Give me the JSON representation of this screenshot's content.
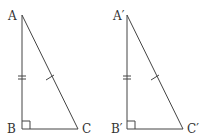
{
  "diagram": {
    "triangles": [
      {
        "name": "ABC",
        "labels": {
          "top": "A",
          "right_angle": "B",
          "base_end": "C"
        },
        "right_angle_at": "B",
        "marks": {
          "vertical_leg": "double-tick",
          "hypotenuse": "single-tick"
        }
      },
      {
        "name": "A'B'C'",
        "labels": {
          "top": "A′",
          "right_angle": "B′",
          "base_end": "C′"
        },
        "right_angle_at": "B′",
        "marks": {
          "vertical_leg": "double-tick",
          "hypotenuse": "single-tick"
        }
      }
    ],
    "colors": {
      "stroke": "#444444",
      "text": "#333333",
      "background": "#ffffff"
    }
  }
}
